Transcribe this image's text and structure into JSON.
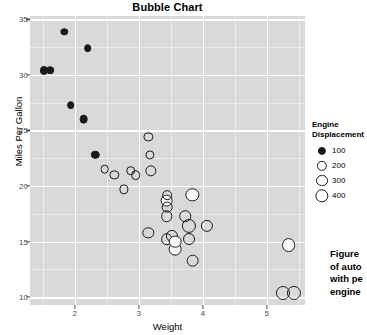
{
  "chart_data": {
    "type": "scatter",
    "title": "Bubble Chart",
    "xlabel": "Weight",
    "ylabel": "Miles Per Gallon",
    "xlim": [
      1.3,
      5.6
    ],
    "ylim": [
      9.3,
      35.3
    ],
    "xticks": [
      "2",
      "3",
      "4",
      "5"
    ],
    "xtick_values": [
      2,
      3,
      4,
      5
    ],
    "yticks": [
      "10",
      "15",
      "20",
      "25",
      "30",
      "35"
    ],
    "ytick_values": [
      10,
      15,
      20,
      25,
      30,
      35
    ],
    "grid": true,
    "legend_position": "right",
    "size_legend": {
      "title_line1": "Engine",
      "title_line2": "Displacement",
      "entries": [
        {
          "label": "100",
          "value": 100
        },
        {
          "label": "200",
          "value": 200
        },
        {
          "label": "300",
          "value": 300
        },
        {
          "label": "400",
          "value": 400
        }
      ]
    },
    "size_key": "Engine Displacement",
    "points": [
      {
        "x": 1.513,
        "y": 30.4,
        "size": 95,
        "fill": "dark"
      },
      {
        "x": 1.615,
        "y": 30.4,
        "size": 79,
        "fill": "dark"
      },
      {
        "x": 1.835,
        "y": 33.9,
        "size": 71,
        "fill": "dark"
      },
      {
        "x": 1.935,
        "y": 27.3,
        "size": 79,
        "fill": "dark"
      },
      {
        "x": 2.14,
        "y": 26.0,
        "size": 120,
        "fill": "dark"
      },
      {
        "x": 2.2,
        "y": 32.4,
        "size": 78,
        "fill": "dark"
      },
      {
        "x": 2.32,
        "y": 22.8,
        "size": 108,
        "fill": "dark"
      },
      {
        "x": 2.465,
        "y": 21.5,
        "size": 120,
        "fill": "none"
      },
      {
        "x": 2.62,
        "y": 21.0,
        "size": 146,
        "fill": "none"
      },
      {
        "x": 2.77,
        "y": 19.7,
        "size": 145,
        "fill": "none"
      },
      {
        "x": 2.875,
        "y": 21.4,
        "size": 160,
        "fill": "none"
      },
      {
        "x": 2.95,
        "y": 21.0,
        "size": 167,
        "fill": "none"
      },
      {
        "x": 3.15,
        "y": 24.4,
        "size": 146,
        "fill": "none"
      },
      {
        "x": 3.17,
        "y": 22.8,
        "size": 141,
        "fill": "none"
      },
      {
        "x": 3.19,
        "y": 21.4,
        "size": 258,
        "fill": "none"
      },
      {
        "x": 3.15,
        "y": 15.8,
        "size": 264,
        "fill": "none"
      },
      {
        "x": 3.435,
        "y": 18.7,
        "size": 360,
        "fill": "light"
      },
      {
        "x": 3.44,
        "y": 19.2,
        "size": 167,
        "fill": "none"
      },
      {
        "x": 3.44,
        "y": 18.1,
        "size": 225,
        "fill": "none"
      },
      {
        "x": 3.44,
        "y": 17.3,
        "size": 275,
        "fill": "none"
      },
      {
        "x": 3.44,
        "y": 15.2,
        "size": 275,
        "fill": "none"
      },
      {
        "x": 3.52,
        "y": 15.5,
        "size": 318,
        "fill": "none"
      },
      {
        "x": 3.57,
        "y": 14.3,
        "size": 360,
        "fill": "light"
      },
      {
        "x": 3.57,
        "y": 15.0,
        "size": 351,
        "fill": "light"
      },
      {
        "x": 3.73,
        "y": 17.3,
        "size": 275,
        "fill": "none"
      },
      {
        "x": 3.78,
        "y": 16.4,
        "size": 472,
        "fill": "none"
      },
      {
        "x": 3.78,
        "y": 15.2,
        "size": 304,
        "fill": "none"
      },
      {
        "x": 3.84,
        "y": 19.2,
        "size": 400,
        "fill": "light"
      },
      {
        "x": 3.845,
        "y": 13.3,
        "size": 350,
        "fill": "none"
      },
      {
        "x": 4.07,
        "y": 16.4,
        "size": 318,
        "fill": "none"
      },
      {
        "x": 5.25,
        "y": 10.4,
        "size": 460,
        "fill": "none"
      },
      {
        "x": 5.345,
        "y": 14.7,
        "size": 440,
        "fill": "light"
      },
      {
        "x": 5.424,
        "y": 10.4,
        "size": 472,
        "fill": "none"
      }
    ]
  },
  "caption": {
    "lines": [
      "Figure ",
      "of auto",
      "with pe",
      "engine"
    ]
  },
  "colors": {
    "panel_background": "#d9d9d9",
    "gridline_major": "#ffffff",
    "gridline_minor": "#ececec",
    "point_stroke": "#1a1a1a",
    "text": "#000000",
    "axis_text": "#4d4d4d"
  }
}
